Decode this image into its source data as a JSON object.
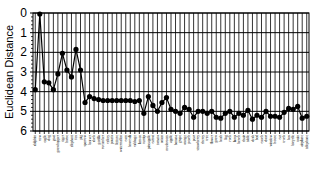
{
  "chart_data": {
    "type": "line",
    "title": "",
    "xlabel": "",
    "ylabel": "Euclidean Distance",
    "ylim": [
      0,
      6
    ],
    "y_inverted": true,
    "yticks": [
      "0",
      "1",
      "2",
      "3",
      "4",
      "5",
      "6"
    ],
    "grid": true,
    "legend": "none",
    "categories": [
      "dolphin",
      "cow",
      "eagle",
      "dog",
      "goat",
      "grasshopper",
      "tiger",
      "horse",
      "elephant",
      "fox",
      "pig",
      "sparrow",
      "beaver",
      "duck",
      "gorilla",
      "cucumber",
      "celery",
      "potato",
      "lettuce",
      "watermelon",
      "corn",
      "broccoli",
      "cabbage",
      "lemon",
      "turnip",
      "pineapple",
      "carrot",
      "tomato",
      "onion",
      "mushroom",
      "apple",
      "banana",
      "grape",
      "orange",
      "peach",
      "pear",
      "strawberry",
      "cherry",
      "tree",
      "flower",
      "grass",
      "bush",
      "log",
      "rock",
      "lamp",
      "bench",
      "chair",
      "table",
      "desk",
      "bed",
      "couch",
      "door",
      "window",
      "house",
      "car",
      "truck",
      "bus",
      "bicycle",
      "train",
      "airplane",
      "telephone"
    ],
    "series": [
      {
        "name": "distance",
        "values": [
          3.9,
          0.05,
          3.5,
          3.55,
          3.9,
          3.1,
          2.05,
          2.9,
          3.25,
          1.85,
          2.9,
          4.55,
          4.25,
          4.35,
          4.4,
          4.45,
          4.45,
          4.45,
          4.45,
          4.45,
          4.45,
          4.45,
          4.5,
          4.45,
          5.1,
          4.25,
          4.7,
          5.0,
          4.55,
          4.3,
          4.9,
          5.0,
          5.1,
          4.8,
          4.9,
          5.3,
          5.0,
          5.0,
          5.1,
          5.0,
          5.3,
          5.35,
          5.1,
          5.0,
          5.3,
          5.1,
          5.2,
          4.95,
          5.4,
          5.2,
          5.3,
          5.0,
          5.25,
          5.25,
          5.3,
          5.05,
          4.85,
          4.9,
          4.75,
          5.35,
          5.25
        ]
      }
    ]
  }
}
